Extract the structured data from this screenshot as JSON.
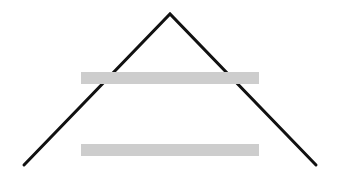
{
  "canvas": {
    "width": 337,
    "height": 178,
    "background": "#ffffff"
  },
  "peak": {
    "color": "#111111",
    "stroke_width": 3,
    "left": {
      "x": 24,
      "y": 165
    },
    "apex": {
      "x": 170,
      "y": 14
    },
    "right": {
      "x": 316,
      "y": 165
    }
  },
  "bars": [
    {
      "name": "upper-bar",
      "x": 81,
      "y": 72,
      "width": 178,
      "height": 12,
      "color": "#cdcdcd"
    },
    {
      "name": "lower-bar",
      "x": 81,
      "y": 144,
      "width": 178,
      "height": 12,
      "color": "#cdcdcd"
    }
  ]
}
